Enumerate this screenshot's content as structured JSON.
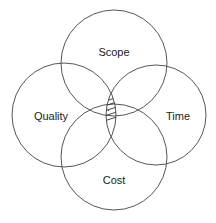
{
  "diagram": {
    "type": "venn",
    "sets": [
      {
        "id": "scope",
        "label": "Scope",
        "cx": 114,
        "cy": 63,
        "r": 53,
        "label_x": 114,
        "label_y": 53
      },
      {
        "id": "quality",
        "label": "Quality",
        "cx": 64,
        "cy": 115,
        "r": 52,
        "label_x": 51,
        "label_y": 117
      },
      {
        "id": "time",
        "label": "Time",
        "cx": 156,
        "cy": 115,
        "r": 50,
        "label_x": 178,
        "label_y": 117
      },
      {
        "id": "cost",
        "label": "Cost",
        "cx": 114,
        "cy": 157,
        "r": 53,
        "label_x": 114,
        "label_y": 181
      }
    ],
    "highlight": {
      "region": "intersection of all four",
      "style": "hatched"
    },
    "stroke_color": "#555555",
    "background": "#ffffff"
  }
}
